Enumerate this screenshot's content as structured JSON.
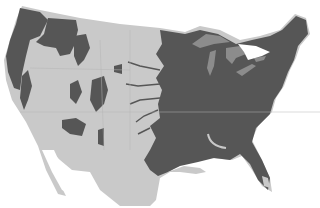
{
  "map": {
    "subject": "Contiguous United States forest cover",
    "colors": {
      "background": "#ffffff",
      "land": "#c9c9c9",
      "forest": "#565656",
      "lakes": "#8c8c8c",
      "borders": "#b4b4b4"
    },
    "legend": [],
    "labels": []
  }
}
